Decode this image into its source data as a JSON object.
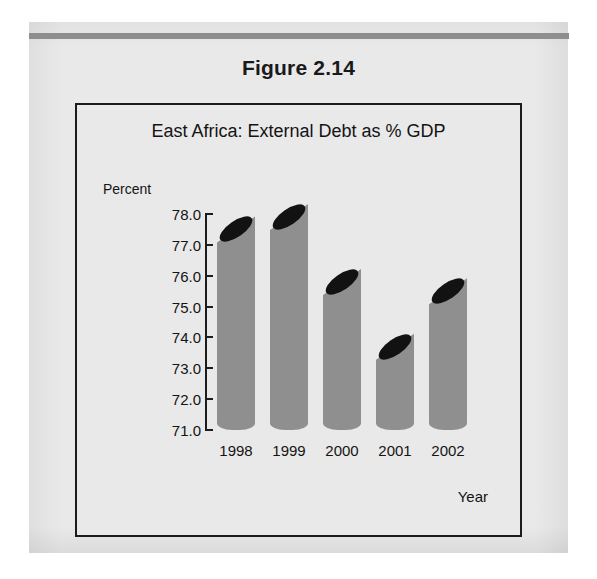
{
  "figure": {
    "number_label": "Figure 2.14"
  },
  "chart_data": {
    "type": "bar",
    "title": "East Africa: External Debt as % GDP",
    "xlabel": "Year",
    "ylabel": "Percent",
    "categories": [
      "1998",
      "1999",
      "2000",
      "2001",
      "2002"
    ],
    "values": [
      77.5,
      77.9,
      75.8,
      73.7,
      75.5
    ],
    "ylim": [
      71.0,
      78.0
    ],
    "ytick_step": 1.0,
    "yticks": [
      "78.0",
      "77.0",
      "76.0",
      "75.0",
      "74.0",
      "73.0",
      "72.0",
      "71.0"
    ],
    "ytick_values": [
      78.0,
      77.0,
      76.0,
      75.0,
      74.0,
      73.0,
      72.0,
      71.0
    ],
    "grid": false,
    "legend": false,
    "bar_style": "cylinder-angled-top",
    "colors": {
      "bar_fill": "#8f8f8f",
      "bar_top": "#121212",
      "axis": "#1c1c1c",
      "text": "#141414",
      "page_background": "#e9e9e9",
      "rule": "#8e8e8e"
    }
  }
}
